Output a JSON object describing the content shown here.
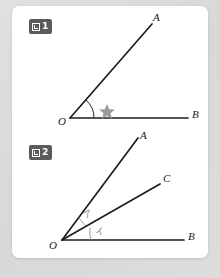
{
  "page": {
    "background_color": "#dcdcdc",
    "card_color": "#ffffff"
  },
  "figures": [
    {
      "badge_icon": "zu-box-icon",
      "badge_number": "1",
      "points": {
        "O": "O",
        "A": "A",
        "B": "B"
      },
      "angle_marks": [
        {
          "name": "star-angle-mark",
          "symbol": "★",
          "color": "#9a9a9a"
        }
      ]
    },
    {
      "badge_icon": "zu-box-icon",
      "badge_number": "2",
      "points": {
        "O": "O",
        "A": "A",
        "C": "C",
        "B": "B"
      },
      "angle_marks": [
        {
          "name": "angle-label-a",
          "symbol": "ア",
          "color": "#8a8a8a"
        },
        {
          "name": "angle-label-i",
          "symbol": "イ",
          "color": "#8a8a8a"
        }
      ]
    }
  ]
}
